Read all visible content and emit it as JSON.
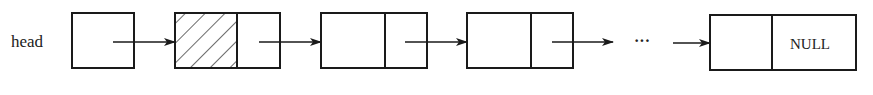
{
  "diagram": {
    "type": "singly-linked-list",
    "head_label": "head",
    "ellipsis": "···",
    "null_label": "NULL",
    "stroke_color": "#1a1a1a",
    "background": "#ffffff",
    "nodes": [
      {
        "id": "head-pointer",
        "kind": "pointer",
        "hatched": false
      },
      {
        "id": "header-node",
        "kind": "node",
        "hatched": true
      },
      {
        "id": "node-1",
        "kind": "node",
        "hatched": false
      },
      {
        "id": "node-2",
        "kind": "node",
        "hatched": false
      },
      {
        "id": "last-node",
        "kind": "node",
        "hatched": false,
        "next": "NULL"
      }
    ]
  }
}
